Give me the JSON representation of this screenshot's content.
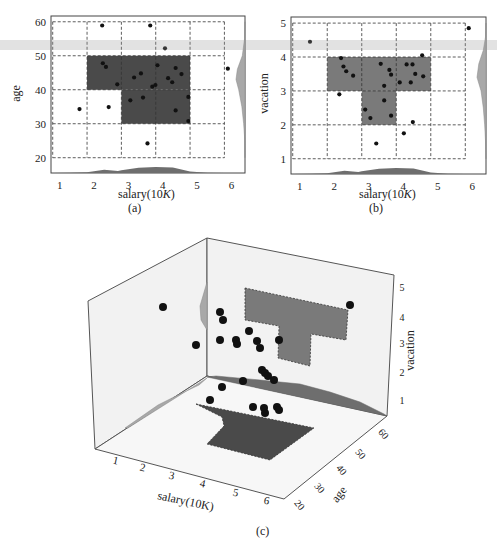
{
  "figure": {
    "panels": [
      {
        "id": "a",
        "caption": "(a)",
        "xlabel_main": "salary(10",
        "xlabel_italic": "K",
        "xlabel_end": ")",
        "ylabel": "age"
      },
      {
        "id": "b",
        "caption": "(b)",
        "xlabel_main": "salary(10",
        "xlabel_italic": "K",
        "xlabel_end": ")",
        "ylabel": "vacation"
      },
      {
        "id": "c",
        "caption": "(c)",
        "xlabel": "salary(10K)",
        "ylabel": "age",
        "zlabel": "vacation"
      }
    ],
    "colors": {
      "dark_region": "#4a4a4a",
      "mid_region": "#7a7a7a",
      "density_fill": "#6e6e6e",
      "density_light": "#a8a8a8",
      "point": "#111111",
      "wall": "#f2f2f2",
      "floor": "#f7f7f7",
      "edge": "#555555"
    }
  },
  "chart_data": [
    {
      "panel": "a",
      "type": "scatter",
      "title": "",
      "xlabel": "salary(10K)",
      "ylabel": "age",
      "xticks": [
        1,
        2,
        3,
        4,
        5,
        6
      ],
      "yticks": [
        20,
        30,
        40,
        50,
        60
      ],
      "xlim": [
        0.95,
        6.6
      ],
      "ylim": [
        15.5,
        61.7
      ],
      "grid": "dashed",
      "highlight_regions": [
        {
          "x": [
            2,
            5
          ],
          "y": [
            40,
            50
          ]
        },
        {
          "x": [
            3,
            5
          ],
          "y": [
            30,
            40
          ]
        }
      ],
      "marginal_x_density": [
        [
          1.0,
          0.0
        ],
        [
          1.5,
          0.02
        ],
        [
          2.0,
          0.1
        ],
        [
          2.5,
          0.45
        ],
        [
          2.9,
          0.3
        ],
        [
          3.0,
          0.4
        ],
        [
          3.5,
          0.75
        ],
        [
          4.0,
          0.85
        ],
        [
          4.5,
          0.8
        ],
        [
          5.0,
          0.2
        ],
        [
          5.5,
          0.05
        ],
        [
          6.0,
          0.0
        ]
      ],
      "marginal_y_density": [
        [
          20,
          0.0
        ],
        [
          25,
          0.02
        ],
        [
          30,
          0.15
        ],
        [
          35,
          0.35
        ],
        [
          40,
          0.7
        ],
        [
          43,
          1.0
        ],
        [
          46,
          0.85
        ],
        [
          50,
          0.3
        ],
        [
          55,
          0.05
        ],
        [
          60,
          0.0
        ]
      ],
      "points": [
        {
          "x": 2.44,
          "y": 58.9
        },
        {
          "x": 3.84,
          "y": 58.9
        },
        {
          "x": 4.27,
          "y": 52.2
        },
        {
          "x": 2.46,
          "y": 47.8
        },
        {
          "x": 2.55,
          "y": 46.7
        },
        {
          "x": 2.88,
          "y": 41.6
        },
        {
          "x": 3.37,
          "y": 43.6
        },
        {
          "x": 3.57,
          "y": 44.8
        },
        {
          "x": 4.05,
          "y": 47.2
        },
        {
          "x": 3.9,
          "y": 40.9
        },
        {
          "x": 3.99,
          "y": 41.4
        },
        {
          "x": 4.36,
          "y": 43.4
        },
        {
          "x": 4.48,
          "y": 42.2
        },
        {
          "x": 4.58,
          "y": 46.4
        },
        {
          "x": 4.75,
          "y": 44.6
        },
        {
          "x": 3.26,
          "y": 36.9
        },
        {
          "x": 3.63,
          "y": 37.7
        },
        {
          "x": 4.95,
          "y": 37.9
        },
        {
          "x": 4.58,
          "y": 33.9
        },
        {
          "x": 4.95,
          "y": 30.8
        },
        {
          "x": 1.78,
          "y": 34.3
        },
        {
          "x": 2.63,
          "y": 34.9
        },
        {
          "x": 3.76,
          "y": 24.2
        },
        {
          "x": 6.1,
          "y": 46.2
        }
      ]
    },
    {
      "panel": "b",
      "type": "scatter",
      "title": "",
      "xlabel": "salary(10K)",
      "ylabel": "vacation",
      "xticks": [
        1,
        2,
        3,
        4,
        5,
        6
      ],
      "yticks": [
        1,
        2,
        3,
        4,
        5
      ],
      "xlim": [
        0.95,
        6.6
      ],
      "ylim": [
        0.55,
        5.18
      ],
      "grid": "dashed",
      "highlight_regions": [
        {
          "x": [
            2,
            5
          ],
          "y": [
            3,
            4
          ]
        },
        {
          "x": [
            3,
            4
          ],
          "y": [
            2,
            3
          ]
        }
      ],
      "marginal_x_density": [
        [
          1.0,
          0.0
        ],
        [
          1.5,
          0.02
        ],
        [
          2.0,
          0.1
        ],
        [
          2.5,
          0.45
        ],
        [
          2.9,
          0.3
        ],
        [
          3.0,
          0.4
        ],
        [
          3.5,
          0.75
        ],
        [
          4.0,
          0.85
        ],
        [
          4.5,
          0.8
        ],
        [
          5.0,
          0.2
        ],
        [
          5.5,
          0.05
        ],
        [
          6.0,
          0.0
        ]
      ],
      "marginal_y_density": [
        [
          1,
          0.0
        ],
        [
          1.5,
          0.05
        ],
        [
          2,
          0.15
        ],
        [
          2.5,
          0.3
        ],
        [
          3,
          0.55
        ],
        [
          3.4,
          1.0
        ],
        [
          3.8,
          0.8
        ],
        [
          4.2,
          0.3
        ],
        [
          4.6,
          0.05
        ],
        [
          5,
          0.0
        ]
      ],
      "points": [
        {
          "x": 1.5,
          "y": 4.45
        },
        {
          "x": 6.1,
          "y": 4.85
        },
        {
          "x": 2.4,
          "y": 3.97
        },
        {
          "x": 2.47,
          "y": 3.72
        },
        {
          "x": 2.55,
          "y": 3.58
        },
        {
          "x": 2.75,
          "y": 3.45
        },
        {
          "x": 2.35,
          "y": 2.9
        },
        {
          "x": 3.55,
          "y": 3.8
        },
        {
          "x": 3.8,
          "y": 3.62
        },
        {
          "x": 3.85,
          "y": 3.48
        },
        {
          "x": 3.65,
          "y": 3.15
        },
        {
          "x": 3.65,
          "y": 2.72
        },
        {
          "x": 4.3,
          "y": 3.78
        },
        {
          "x": 4.47,
          "y": 3.78
        },
        {
          "x": 4.55,
          "y": 3.5
        },
        {
          "x": 4.1,
          "y": 3.25
        },
        {
          "x": 4.42,
          "y": 3.25
        },
        {
          "x": 4.75,
          "y": 4.05
        },
        {
          "x": 4.78,
          "y": 3.43
        },
        {
          "x": 3.1,
          "y": 2.45
        },
        {
          "x": 3.25,
          "y": 2.2
        },
        {
          "x": 3.85,
          "y": 2.27
        },
        {
          "x": 4.48,
          "y": 2.08
        },
        {
          "x": 4.22,
          "y": 1.75
        },
        {
          "x": 3.42,
          "y": 1.45
        }
      ]
    },
    {
      "panel": "c",
      "type": "scatter3d",
      "title": "",
      "xlabel": "salary(10K)",
      "ylabel": "age",
      "zlabel": "vacation",
      "xticks": [
        1,
        2,
        3,
        4,
        5,
        6
      ],
      "yticks": [
        20,
        30,
        40,
        50,
        60
      ],
      "zticks": [
        1,
        2,
        3,
        4,
        5
      ],
      "projected_regions": {
        "floor_salary_age": [
          {
            "x": [
              2,
              5
            ],
            "y": [
              40,
              50
            ]
          },
          {
            "x": [
              3,
              5
            ],
            "y": [
              30,
              40
            ]
          }
        ],
        "wall_salary_vacation": [
          {
            "x": [
              2,
              5
            ],
            "y": [
              3,
              4
            ]
          },
          {
            "x": [
              3,
              4
            ],
            "y": [
              2,
              3
            ]
          }
        ]
      },
      "screen_points": [
        [
          163,
          307
        ],
        [
          196,
          345
        ],
        [
          220,
          312
        ],
        [
          223,
          320
        ],
        [
          220,
          340
        ],
        [
          236,
          340
        ],
        [
          237,
          344
        ],
        [
          249,
          331
        ],
        [
          257,
          341
        ],
        [
          260,
          348
        ],
        [
          279,
          340
        ],
        [
          350,
          305
        ],
        [
          262,
          370
        ],
        [
          265,
          373
        ],
        [
          268,
          376
        ],
        [
          274,
          380
        ],
        [
          222,
          387
        ],
        [
          243,
          381
        ],
        [
          210,
          400
        ],
        [
          253,
          407
        ],
        [
          264,
          408
        ],
        [
          265,
          413
        ],
        [
          277,
          407
        ],
        [
          279,
          410
        ]
      ]
    }
  ]
}
